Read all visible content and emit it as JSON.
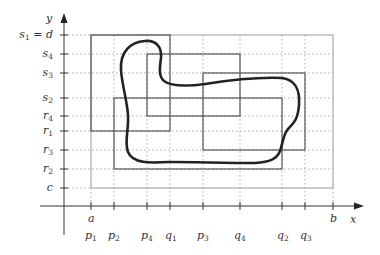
{
  "diagram": {
    "axes": {
      "x_label": "x",
      "y_label": "y",
      "x_axis_bound_labels": {
        "a": "a",
        "b": "b"
      }
    },
    "x_ticks": [
      {
        "name": "p",
        "sub": "1",
        "x": 91
      },
      {
        "name": "p",
        "sub": "2",
        "x": 114
      },
      {
        "name": "p",
        "sub": "4",
        "x": 147
      },
      {
        "name": "q",
        "sub": "1",
        "x": 170
      },
      {
        "name": "p",
        "sub": "3",
        "x": 203
      },
      {
        "name": "q",
        "sub": "4",
        "x": 240
      },
      {
        "name": "q",
        "sub": "2",
        "x": 282
      },
      {
        "name": "q",
        "sub": "3",
        "x": 305
      }
    ],
    "y_ticks": [
      {
        "name": "s",
        "sub": "1",
        "suffix": " = d",
        "y": 35
      },
      {
        "name": "s",
        "sub": "4",
        "suffix": "",
        "y": 54
      },
      {
        "name": "s",
        "sub": "3",
        "suffix": "",
        "y": 73
      },
      {
        "name": "s",
        "sub": "2",
        "suffix": "",
        "y": 98
      },
      {
        "name": "r",
        "sub": "4",
        "suffix": "",
        "y": 116
      },
      {
        "name": "r",
        "sub": "1",
        "suffix": "",
        "y": 131
      },
      {
        "name": "r",
        "sub": "3",
        "suffix": "",
        "y": 150
      },
      {
        "name": "r",
        "sub": "2",
        "suffix": "",
        "y": 169
      },
      {
        "name": "c",
        "sub": "",
        "suffix": "",
        "y": 188
      }
    ],
    "bounding_box": {
      "label": "[a,b] x [c,d]",
      "x1": 91,
      "y1": 35,
      "x2": 333,
      "y2": 188
    },
    "rectangles": [
      {
        "name": "R1",
        "x": "p1..q1",
        "y": "r1..s1"
      },
      {
        "name": "R2",
        "x": "p2..q2",
        "y": "r2..s2"
      },
      {
        "name": "R3",
        "x": "p3..q3",
        "y": "r3..s3"
      },
      {
        "name": "R4",
        "x": "p4..q4",
        "y": "r4..s4"
      }
    ],
    "curve": "closed curve covered by the four rectangles"
  }
}
